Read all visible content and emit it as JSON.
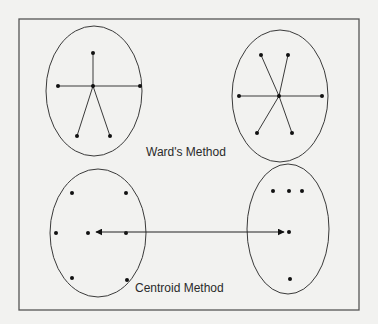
{
  "diagram": {
    "colors": {
      "background": "#f2f2f0",
      "stroke": "#3a3a3a",
      "point": "#111111",
      "text": "#2a2a2a"
    },
    "frame": {
      "x": 19,
      "y": 19,
      "width": 340,
      "height": 291
    },
    "labels": {
      "ward": "Ward's Method",
      "centroid": "Centroid Method"
    },
    "ward": {
      "left_cluster": {
        "ellipse": {
          "cx": 94,
          "cy": 91,
          "rx": 48,
          "ry": 65
        },
        "center": [
          93,
          86
        ],
        "points": [
          [
            93,
            53
          ],
          [
            58,
            86
          ],
          [
            140,
            86
          ],
          [
            77,
            136
          ],
          [
            110,
            136
          ]
        ]
      },
      "right_cluster": {
        "ellipse": {
          "cx": 280,
          "cy": 96,
          "rx": 48,
          "ry": 66
        },
        "center": [
          279,
          96
        ],
        "points": [
          [
            261,
            55
          ],
          [
            288,
            55
          ],
          [
            239,
            96
          ],
          [
            322,
            96
          ],
          [
            257,
            133
          ],
          [
            292,
            133
          ]
        ]
      }
    },
    "centroid": {
      "left_cluster": {
        "ellipse": {
          "cx": 98,
          "cy": 233,
          "rx": 48,
          "ry": 64
        },
        "points": [
          [
            72,
            193
          ],
          [
            126,
            193
          ],
          [
            56,
            233
          ],
          [
            88,
            233
          ],
          [
            126,
            233
          ],
          [
            72,
            278
          ],
          [
            127,
            280
          ]
        ]
      },
      "right_cluster": {
        "ellipse": {
          "cx": 288,
          "cy": 229,
          "rx": 41,
          "ry": 65
        },
        "points": [
          [
            273,
            191
          ],
          [
            289,
            191
          ],
          [
            302,
            191
          ],
          [
            289,
            232
          ],
          [
            290,
            279
          ]
        ]
      },
      "arrow": {
        "x1": 96,
        "y1": 232,
        "x2": 284,
        "y2": 232,
        "double_headed": true
      }
    }
  }
}
